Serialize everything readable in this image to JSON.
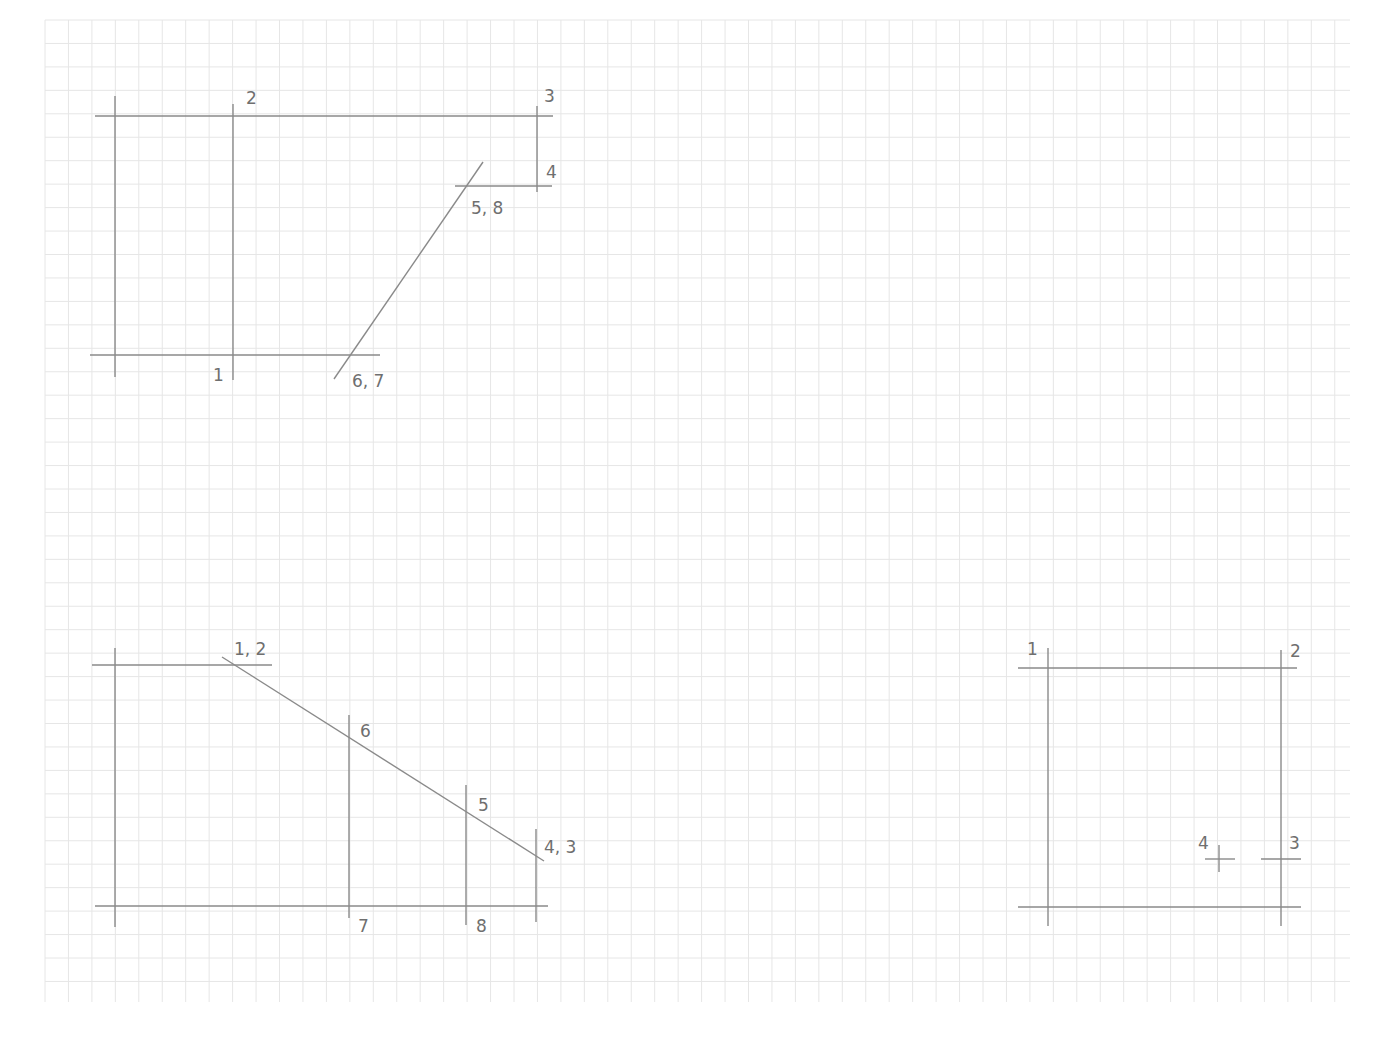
{
  "page": {
    "background": "#ffffff",
    "grid": {
      "x0": 45,
      "y0": 20,
      "x1": 1350,
      "y1": 1002,
      "step": 23.45,
      "color": "#e6e6e6"
    },
    "line_color": "#8a8a8a"
  },
  "figures": [
    {
      "id": "top-left",
      "lines": [
        [
          95,
          116,
          553,
          116
        ],
        [
          90,
          355,
          380,
          355
        ],
        [
          115,
          96,
          115,
          377
        ],
        [
          233,
          104,
          233,
          380
        ],
        [
          537,
          106,
          537,
          192
        ],
        [
          455,
          186,
          552,
          186
        ],
        [
          483,
          162,
          334,
          379
        ]
      ],
      "labels": [
        {
          "text": "2",
          "x": 246,
          "y": 104
        },
        {
          "text": "3",
          "x": 544,
          "y": 102
        },
        {
          "text": "4",
          "x": 546,
          "y": 178
        },
        {
          "text": "5, 8",
          "x": 471,
          "y": 214
        },
        {
          "text": "1",
          "x": 213,
          "y": 381
        },
        {
          "text": "6, 7",
          "x": 352,
          "y": 387
        }
      ]
    },
    {
      "id": "bottom-left",
      "lines": [
        [
          92,
          665,
          272,
          665
        ],
        [
          115,
          648,
          115,
          927
        ],
        [
          95,
          906,
          548,
          906
        ],
        [
          222,
          657,
          544,
          861
        ],
        [
          349,
          715,
          349,
          918
        ],
        [
          466,
          785,
          466,
          925
        ],
        [
          536,
          829,
          536,
          922
        ]
      ],
      "labels": [
        {
          "text": "1, 2",
          "x": 234,
          "y": 655
        },
        {
          "text": "6",
          "x": 360,
          "y": 737
        },
        {
          "text": "5",
          "x": 478,
          "y": 811
        },
        {
          "text": "4, 3",
          "x": 544,
          "y": 853
        },
        {
          "text": "7",
          "x": 358,
          "y": 932
        },
        {
          "text": "8",
          "x": 476,
          "y": 932
        }
      ]
    },
    {
      "id": "bottom-right",
      "lines": [
        [
          1018,
          668,
          1297,
          668
        ],
        [
          1048,
          648,
          1048,
          926
        ],
        [
          1281,
          650,
          1281,
          926
        ],
        [
          1018,
          907,
          1301,
          907
        ],
        [
          1261,
          859,
          1301,
          859
        ],
        [
          1205,
          859,
          1235,
          859
        ],
        [
          1219,
          845,
          1219,
          872
        ]
      ],
      "labels": [
        {
          "text": "1",
          "x": 1027,
          "y": 655
        },
        {
          "text": "2",
          "x": 1290,
          "y": 657
        },
        {
          "text": "4",
          "x": 1198,
          "y": 849
        },
        {
          "text": "3",
          "x": 1289,
          "y": 849
        }
      ]
    }
  ]
}
